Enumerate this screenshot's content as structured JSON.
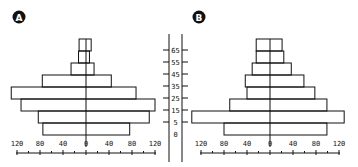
{
  "chart_data": [
    {
      "type": "bar",
      "subtype": "population-pyramid",
      "title": "A",
      "categories": [
        "0",
        "5",
        "15",
        "25",
        "35",
        "45",
        "55",
        "65"
      ],
      "series": [
        {
          "name": "left",
          "values": [
            75,
            83,
            113,
            130,
            76,
            26,
            13,
            12
          ]
        },
        {
          "name": "right",
          "values": [
            76,
            110,
            120,
            87,
            44,
            14,
            6,
            9
          ]
        }
      ],
      "xlabel": "",
      "ylabel": "",
      "x_ticks": [
        "120",
        "80",
        "40",
        "0",
        "40",
        "80",
        "120"
      ],
      "xlim": [
        -120,
        120
      ],
      "grid": false,
      "legend": "none"
    },
    {
      "type": "bar",
      "subtype": "population-pyramid",
      "title": "B",
      "categories": [
        "0",
        "5",
        "15",
        "25",
        "35",
        "45",
        "55",
        "65"
      ],
      "series": [
        {
          "name": "left",
          "values": [
            80,
            136,
            70,
            40,
            43,
            31,
            24,
            24
          ]
        },
        {
          "name": "right",
          "values": [
            99,
            129,
            99,
            78,
            59,
            37,
            24,
            21
          ]
        }
      ],
      "xlabel": "",
      "ylabel": "",
      "x_ticks": [
        "120",
        "80",
        "40",
        "0",
        "40",
        "80",
        "120"
      ],
      "xlim": [
        -120,
        120
      ],
      "grid": false,
      "legend": "none"
    }
  ],
  "panels": {
    "a": {
      "badge": "A"
    },
    "b": {
      "badge": "B"
    }
  },
  "age_axis": {
    "labels": [
      "65",
      "55",
      "45",
      "35",
      "25",
      "15",
      "5",
      "0"
    ]
  },
  "x_axis": {
    "tick_labels": [
      "120",
      "80",
      "40",
      "0",
      "40",
      "80",
      "120"
    ]
  }
}
